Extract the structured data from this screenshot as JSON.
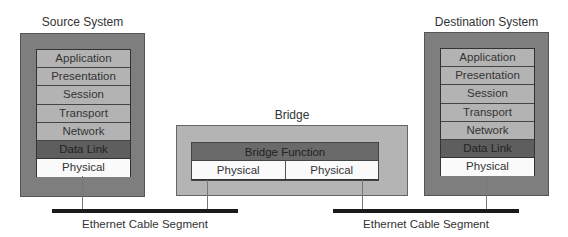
{
  "source_system": {
    "title": "Source System",
    "layers": [
      "Application",
      "Presentation",
      "Session",
      "Transport",
      "Network",
      "Data Link",
      "Physical"
    ]
  },
  "destination_system": {
    "title": "Destination System",
    "layers": [
      "Application",
      "Presentation",
      "Session",
      "Transport",
      "Network",
      "Data Link",
      "Physical"
    ]
  },
  "bridge": {
    "title": "Bridge",
    "function_label": "Bridge Function",
    "physical_left": "Physical",
    "physical_right": "Physical"
  },
  "cables": {
    "left_label": "Ethernet Cable Segment",
    "right_label": "Ethernet Cable Segment"
  },
  "colors": {
    "system_fill": "#7e7e7e",
    "layer_fill": "#b3b3b3",
    "datalink_fill": "#5e5e5e",
    "physical_fill": "#fafafa",
    "bridge_fill": "#b4b4b4",
    "cable": "#1a1a1a"
  }
}
